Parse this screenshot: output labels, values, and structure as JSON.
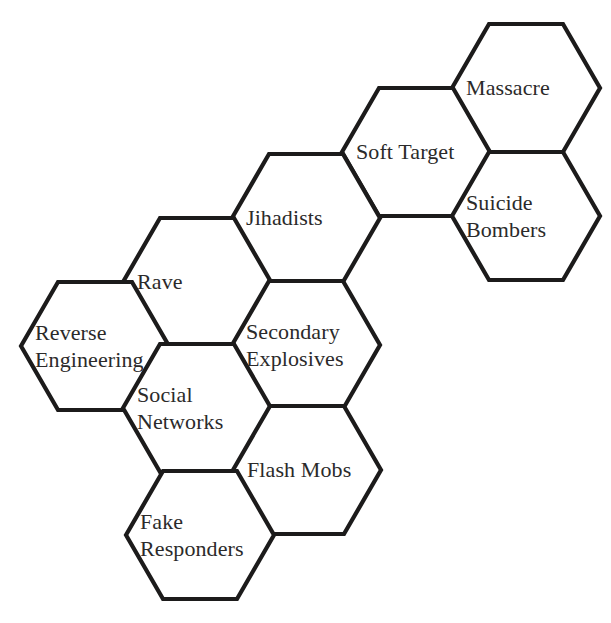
{
  "diagram": {
    "type": "hexagonal-concept-map",
    "title": "",
    "background_color": "#ffffff",
    "stroke_color": "#1c1b1b",
    "text_color": "#2b2a2a",
    "hex_width": 148,
    "hex_height": 128,
    "cells": [
      {
        "id": "massacre",
        "label": "Massacre",
        "lines": [
          "Massacre"
        ],
        "left_vertex_x": 452,
        "left_vertex_y": 88
      },
      {
        "id": "soft-target",
        "label": "Soft Target",
        "lines": [
          "Soft Target"
        ],
        "left_vertex_x": 342,
        "left_vertex_y": 152
      },
      {
        "id": "suicide-bombers",
        "label": "Suicide Bombers",
        "lines": [
          "Suicide",
          "Bombers"
        ],
        "left_vertex_x": 452,
        "left_vertex_y": 216
      },
      {
        "id": "jihadists",
        "label": "Jihadists",
        "lines": [
          "Jihadists"
        ],
        "left_vertex_x": 232,
        "left_vertex_y": 218
      },
      {
        "id": "rave",
        "label": "Rave",
        "lines": [
          "Rave"
        ],
        "left_vertex_x": 123,
        "left_vertex_y": 282
      },
      {
        "id": "secondary-explosives",
        "label": "Secondary Explosives",
        "lines": [
          "Secondary",
          "Explosives"
        ],
        "left_vertex_x": 232,
        "left_vertex_y": 345
      },
      {
        "id": "reverse-engineering",
        "label": "Reverse Engineering",
        "lines": [
          "Reverse",
          "Engineering"
        ],
        "left_vertex_x": 21,
        "left_vertex_y": 346
      },
      {
        "id": "social-networks",
        "label": "Social Networks",
        "lines": [
          "Social",
          "Networks"
        ],
        "left_vertex_x": 123,
        "left_vertex_y": 408
      },
      {
        "id": "flash-mobs",
        "label": "Flash Mobs",
        "lines": [
          "Flash Mobs"
        ],
        "left_vertex_x": 233,
        "left_vertex_y": 470
      },
      {
        "id": "fake-responders",
        "label": "Fake Responders",
        "lines": [
          "Fake",
          "Responders"
        ],
        "left_vertex_x": 126,
        "left_vertex_y": 535
      }
    ]
  }
}
